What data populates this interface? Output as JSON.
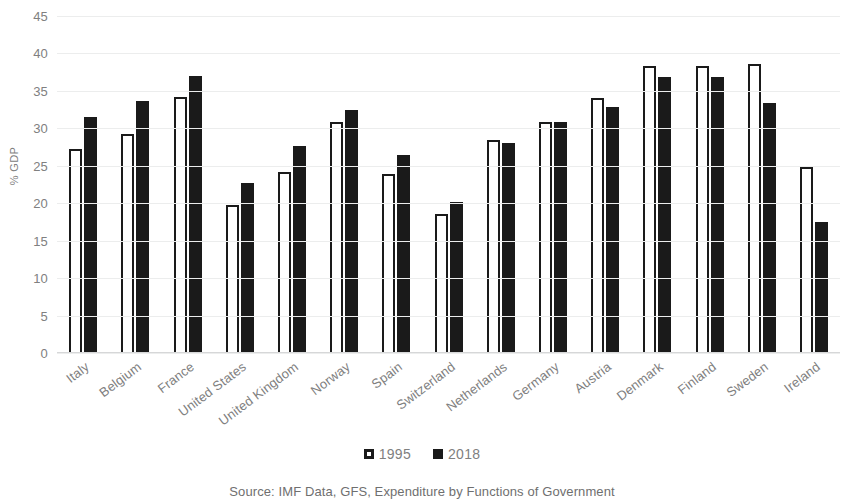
{
  "chart_data": {
    "type": "bar",
    "title": "",
    "xlabel": "",
    "ylabel": "% GDP",
    "ylim": [
      0,
      45
    ],
    "yticks": [
      0,
      5,
      10,
      15,
      20,
      25,
      30,
      35,
      40,
      45
    ],
    "grid": true,
    "legend_position": "bottom",
    "categories": [
      "Italy",
      "Belgium",
      "France",
      "United States",
      "United Kingdom",
      "Norway",
      "Spain",
      "Switzerland",
      "Netherlands",
      "Germany",
      "Austria",
      "Denmark",
      "Finland",
      "Sweden",
      "Ireland"
    ],
    "series": [
      {
        "name": "1995",
        "color": "#ffffff",
        "edge_color": "#1a1a1a",
        "values": [
          27.2,
          29.3,
          34.2,
          19.8,
          24.2,
          30.8,
          23.9,
          18.5,
          28.5,
          30.8,
          34.1,
          38.3,
          38.3,
          38.6,
          24.9
        ]
      },
      {
        "name": "2018",
        "color": "#1a1a1a",
        "edge_color": "#1a1a1a",
        "values": [
          31.5,
          33.7,
          37.0,
          22.7,
          27.6,
          32.5,
          26.5,
          20.1,
          28.0,
          30.8,
          32.8,
          36.9,
          36.9,
          33.4,
          17.5
        ]
      }
    ],
    "source": "Source: IMF Data, GFS, Expenditure by Functions of Government"
  }
}
